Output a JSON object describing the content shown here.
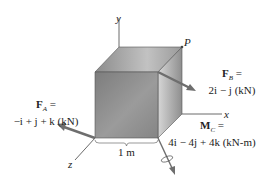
{
  "figure": {
    "axes": {
      "x": "x",
      "y": "y",
      "z": "z"
    },
    "point_label": "P",
    "dimension": "1 m",
    "forces": [
      {
        "name": "F_A",
        "symbol": "F",
        "subscript": "A",
        "eq": "=",
        "value": "−i + j + k (kN)"
      },
      {
        "name": "F_B",
        "symbol": "F",
        "subscript": "B",
        "eq": "=",
        "value": "2i − j (kN)"
      }
    ],
    "moment": {
      "name": "M_C",
      "symbol": "M",
      "subscript": "C",
      "eq": "=",
      "value": "4i − 4j + 4k (kN-m)"
    },
    "colors": {
      "cube_front": "#8a8a8a",
      "cube_top": "#a5a5a5",
      "cube_side": "#b8b8b8",
      "arrow": "#6e6e6e",
      "axis": "#444444"
    }
  }
}
